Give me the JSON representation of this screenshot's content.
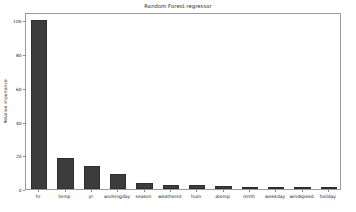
{
  "chart_data": {
    "type": "bar",
    "title": "Random Forest regressor",
    "xlabel": "",
    "ylabel": "Relative importance",
    "categories": [
      "hr",
      "temp",
      "yr",
      "workingday",
      "season",
      "weathersit",
      "hum",
      "atemp",
      "mnth",
      "weekday",
      "windspeed",
      "holiday"
    ],
    "values": [
      100.0,
      18.6,
      13.5,
      9.2,
      3.3,
      2.5,
      2.4,
      1.9,
      1.2,
      1.0,
      0.3,
      0.1
    ],
    "ylim": [
      0,
      105
    ],
    "yticks": [
      0,
      20,
      40,
      60,
      80,
      100
    ],
    "ytick_labels": [
      "0",
      "20",
      "40",
      "60",
      "80",
      "100"
    ],
    "grid": false,
    "legend": null,
    "bar_color": "#3c3c3c",
    "background_color": "#ffffff",
    "axis_color": "#9a9a9a",
    "text_color": "#1a1a1a"
  }
}
